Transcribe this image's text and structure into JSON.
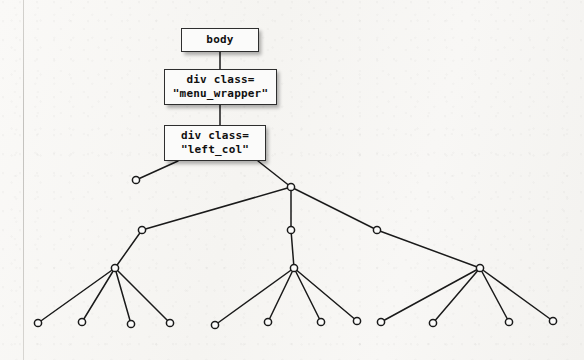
{
  "diagram": {
    "type": "tree",
    "background_color": "#f7f6f4",
    "node_fill": "#fbfbfa",
    "node_stroke": "#2e2e2e",
    "edge_color": "#1a1a1a",
    "labeled_nodes": [
      {
        "id": "body",
        "lines": [
          "body"
        ],
        "x": 181,
        "y": 28,
        "width": 78,
        "height": 24
      },
      {
        "id": "menu_wrapper",
        "lines": [
          "div class=",
          "\"menu_wrapper\""
        ],
        "x": 164,
        "y": 69,
        "width": 113,
        "height": 36
      },
      {
        "id": "left_col",
        "lines": [
          "div class=",
          "\"left_col\""
        ],
        "x": 164,
        "y": 125,
        "width": 102,
        "height": 36
      }
    ],
    "circle_nodes": [
      {
        "id": "c-l1a",
        "x": 136,
        "y": 180
      },
      {
        "id": "c-l1b",
        "x": 291,
        "y": 187
      },
      {
        "id": "c-l2a",
        "x": 142,
        "y": 230
      },
      {
        "id": "c-l2b",
        "x": 291,
        "y": 230
      },
      {
        "id": "c-l2c",
        "x": 377,
        "y": 230
      },
      {
        "id": "c-l3a",
        "x": 115,
        "y": 268
      },
      {
        "id": "c-l3b",
        "x": 294,
        "y": 268
      },
      {
        "id": "c-l3c",
        "x": 480,
        "y": 268
      },
      {
        "id": "leaf-1",
        "x": 38,
        "y": 323
      },
      {
        "id": "leaf-2",
        "x": 82,
        "y": 322
      },
      {
        "id": "leaf-3",
        "x": 131,
        "y": 324
      },
      {
        "id": "leaf-4",
        "x": 170,
        "y": 323
      },
      {
        "id": "leaf-5",
        "x": 215,
        "y": 325
      },
      {
        "id": "leaf-6",
        "x": 268,
        "y": 322
      },
      {
        "id": "leaf-7",
        "x": 321,
        "y": 322
      },
      {
        "id": "leaf-8",
        "x": 357,
        "y": 321
      },
      {
        "id": "leaf-9",
        "x": 381,
        "y": 322
      },
      {
        "id": "leaf-10",
        "x": 433,
        "y": 323
      },
      {
        "id": "leaf-11",
        "x": 509,
        "y": 322
      },
      {
        "id": "leaf-12",
        "x": 553,
        "y": 321
      }
    ],
    "edges": [
      {
        "from": "body",
        "to": "menu_wrapper",
        "x1": 220,
        "y1": 52,
        "x2": 220,
        "y2": 69
      },
      {
        "from": "menu_wrapper",
        "to": "left_col",
        "x1": 220,
        "y1": 105,
        "x2": 220,
        "y2": 125
      },
      {
        "from": "left_col",
        "to": "c-l1a",
        "x1": 178,
        "y1": 161,
        "x2": 136,
        "y2": 180
      },
      {
        "from": "left_col",
        "to": "c-l1b",
        "x1": 258,
        "y1": 161,
        "x2": 291,
        "y2": 187
      },
      {
        "from": "c-l1b",
        "to": "c-l2a",
        "x1": 291,
        "y1": 187,
        "x2": 142,
        "y2": 230
      },
      {
        "from": "c-l1b",
        "to": "c-l2b",
        "x1": 291,
        "y1": 187,
        "x2": 291,
        "y2": 230
      },
      {
        "from": "c-l1b",
        "to": "c-l2c",
        "x1": 291,
        "y1": 187,
        "x2": 377,
        "y2": 230
      },
      {
        "from": "c-l2a",
        "to": "c-l3a",
        "x1": 142,
        "y1": 230,
        "x2": 115,
        "y2": 268
      },
      {
        "from": "c-l2b",
        "to": "c-l3b",
        "x1": 291,
        "y1": 230,
        "x2": 294,
        "y2": 268
      },
      {
        "from": "c-l2c",
        "to": "c-l3c",
        "x1": 377,
        "y1": 230,
        "x2": 480,
        "y2": 268
      },
      {
        "from": "c-l3a",
        "to": "leaf-1",
        "x1": 115,
        "y1": 268,
        "x2": 38,
        "y2": 323
      },
      {
        "from": "c-l3a",
        "to": "leaf-2",
        "x1": 115,
        "y1": 268,
        "x2": 82,
        "y2": 322
      },
      {
        "from": "c-l3a",
        "to": "leaf-3",
        "x1": 115,
        "y1": 268,
        "x2": 131,
        "y2": 324
      },
      {
        "from": "c-l3a",
        "to": "leaf-4",
        "x1": 115,
        "y1": 268,
        "x2": 170,
        "y2": 323
      },
      {
        "from": "c-l3b",
        "to": "leaf-5",
        "x1": 294,
        "y1": 268,
        "x2": 215,
        "y2": 325
      },
      {
        "from": "c-l3b",
        "to": "leaf-6",
        "x1": 294,
        "y1": 268,
        "x2": 268,
        "y2": 322
      },
      {
        "from": "c-l3b",
        "to": "leaf-7",
        "x1": 294,
        "y1": 268,
        "x2": 321,
        "y2": 322
      },
      {
        "from": "c-l3b",
        "to": "leaf-8",
        "x1": 294,
        "y1": 268,
        "x2": 357,
        "y2": 321
      },
      {
        "from": "c-l3c",
        "to": "leaf-9",
        "x1": 480,
        "y1": 268,
        "x2": 381,
        "y2": 322
      },
      {
        "from": "c-l3c",
        "to": "leaf-10",
        "x1": 480,
        "y1": 268,
        "x2": 433,
        "y2": 323
      },
      {
        "from": "c-l3c",
        "to": "leaf-11",
        "x1": 480,
        "y1": 268,
        "x2": 509,
        "y2": 322
      },
      {
        "from": "c-l3c",
        "to": "leaf-12",
        "x1": 480,
        "y1": 268,
        "x2": 553,
        "y2": 321
      }
    ]
  }
}
